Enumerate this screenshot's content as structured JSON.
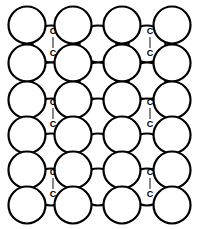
{
  "figure": {
    "type": "molecular-packing-diagram",
    "canvas": {
      "width": 206,
      "height": 229,
      "background": "#ffffff"
    },
    "style": {
      "circle_fill": "#ffffff",
      "circle_stroke": "#000000",
      "circle_stroke_width": 2.2,
      "bond_line_color": "#555555",
      "bond_line_width": 1.4,
      "label_color": "#000000",
      "label_font_size": 9,
      "label_font_weight": "bold"
    },
    "geometry": {
      "circle_radius": 18.5,
      "main_grid": {
        "columns": 4,
        "rows": 6,
        "x_positions": [
          27,
          73,
          122,
          172
        ],
        "y_positions": [
          25,
          63,
          100,
          135,
          170,
          205
        ]
      },
      "offset_grid": {
        "columns": 3,
        "rows": 5,
        "x_positions": [
          51,
          98,
          147
        ],
        "y_positions": [
          44,
          81,
          117,
          152,
          187
        ]
      }
    },
    "bond_labels": [
      {
        "id": "bond-left-1",
        "atom_top": "C",
        "atom_bottom": "C",
        "x": 53,
        "y_top": 34,
        "y_bottom": 56
      },
      {
        "id": "bond-right-1",
        "atom_top": "C",
        "atom_bottom": "C",
        "x": 150,
        "y_top": 34,
        "y_bottom": 56
      },
      {
        "id": "bond-left-2",
        "atom_top": "C",
        "atom_bottom": "C",
        "x": 53,
        "y_top": 105,
        "y_bottom": 127
      },
      {
        "id": "bond-right-2",
        "atom_top": "C",
        "atom_bottom": "C",
        "x": 150,
        "y_top": 105,
        "y_bottom": 127
      },
      {
        "id": "bond-left-3",
        "atom_top": "C",
        "atom_bottom": "C",
        "x": 53,
        "y_top": 175,
        "y_bottom": 197
      },
      {
        "id": "bond-right-3",
        "atom_top": "C",
        "atom_bottom": "C",
        "x": 150,
        "y_top": 175,
        "y_bottom": 197
      }
    ],
    "atom_label_text": "C"
  }
}
